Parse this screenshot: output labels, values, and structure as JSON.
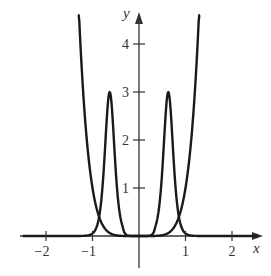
{
  "chart_data": {
    "type": "line",
    "title": "",
    "xlabel": "x",
    "ylabel": "y",
    "xlim": [
      -2.4,
      2.6
    ],
    "ylim": [
      -0.6,
      4.6
    ],
    "grid": false,
    "legend": null,
    "x_ticks": [
      -2,
      -1,
      1,
      2
    ],
    "x_tick_labels": [
      "−2",
      "−1",
      "1",
      "2"
    ],
    "y_ticks": [
      1,
      2,
      3,
      4
    ],
    "y_tick_labels": [
      "1",
      "2",
      "3",
      "4"
    ],
    "series": [
      {
        "name": "U-shaped curve (approx. y = x^6)",
        "x": [
          -1.31,
          -1.2,
          -1.1,
          -1.0,
          -0.9,
          -0.8,
          -0.7,
          -0.6,
          -0.5,
          -0.4,
          -0.3,
          -0.2,
          0,
          0.2,
          0.3,
          0.4,
          0.5,
          0.6,
          0.7,
          0.8,
          0.9,
          1.0,
          1.1,
          1.2,
          1.31
        ],
        "y": [
          5.0,
          2.99,
          1.77,
          1.0,
          0.53,
          0.26,
          0.12,
          0.05,
          0.016,
          0.004,
          0.0007,
          0.0001,
          0,
          0.0001,
          0.0007,
          0.004,
          0.016,
          0.05,
          0.12,
          0.26,
          0.53,
          1.0,
          1.77,
          2.99,
          5.0
        ]
      },
      {
        "name": "Twin-peak curve",
        "x": [
          -2.4,
          -1.2,
          -1.05,
          -0.95,
          -0.88,
          -0.8,
          -0.75,
          -0.7,
          -0.66,
          -0.63,
          -0.6,
          -0.56,
          -0.5,
          -0.45,
          -0.38,
          -0.3,
          -0.2,
          -0.1,
          0,
          0.1,
          0.2,
          0.3,
          0.38,
          0.45,
          0.5,
          0.56,
          0.6,
          0.63,
          0.66,
          0.7,
          0.75,
          0.8,
          0.88,
          0.95,
          1.05,
          1.2,
          2.6
        ],
        "y": [
          0,
          0.01,
          0.08,
          0.2,
          0.38,
          0.8,
          1.4,
          2.2,
          2.8,
          3.0,
          2.8,
          2.2,
          1.4,
          0.8,
          0.38,
          0.15,
          0.04,
          0.005,
          0,
          0.005,
          0.04,
          0.15,
          0.38,
          0.8,
          1.4,
          2.2,
          2.8,
          3.0,
          2.8,
          2.2,
          1.4,
          0.8,
          0.38,
          0.2,
          0.08,
          0.01,
          0
        ]
      }
    ],
    "annotations": [
      {
        "text": "Peaks of height 3 at x ≈ ±0.63"
      }
    ]
  },
  "labels": {
    "x_axis": "x",
    "y_axis": "y"
  },
  "colors": {
    "curve": "#1a1a1a",
    "axis": "#333333",
    "background": "#ffffff"
  }
}
